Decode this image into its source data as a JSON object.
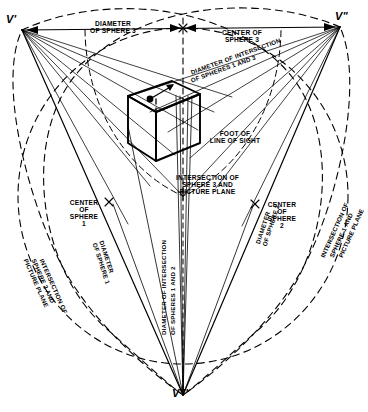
{
  "diagram": {
    "type": "technical-line-drawing",
    "background_color": "#ffffff",
    "ink_color": "#000000",
    "vanishing_points": [
      {
        "id": "v-prime",
        "label": "V'",
        "x": 22,
        "y": 30,
        "role": "left vanishing point"
      },
      {
        "id": "v-double-prime",
        "label": "V\"",
        "x": 340,
        "y": 27,
        "role": "right vanishing point"
      },
      {
        "id": "v-triple-prime",
        "label": "V'''",
        "x": 183,
        "y": 395,
        "role": "bottom vanishing point"
      }
    ],
    "labels": {
      "diameter_of_sphere_3": "DIAMETER\nOF SPHERE 3",
      "center_of_sphere_3": "CENTER OF\nSPHERE 3",
      "diameter_of_intersection_spheres_1_and_3_line1": "DIAMETER OF INTERSECTION",
      "diameter_of_intersection_spheres_1_and_3_line2": "OF SPHERES 1 AND 3",
      "foot_of_line_of_sight": "FOOT OF\nLINE OF SIGHT",
      "intersection_of_sphere_3_and_picture_plane": "INTERSECTION OF\nSPHERE 3 AND\nPICTURE PLANE",
      "center_of_sphere_1": "CENTER\nOF\nSPHERE\n1",
      "center_of_sphere_2": "CENTER\nOF\nSPHERE\n2",
      "diameter_of_intersection_spheres_1_and_2_col1": "DIAMETER OF INTERSECTION",
      "diameter_of_intersection_spheres_1_and_2_col2": "OF SPHERES 1 AND 2",
      "diameter_of_sphere_1": "DIAMETER\nOF SPHERE 1",
      "diameter_of_sphere_2": "DIAMETER\nOF SPHERE 2",
      "intersection_of_sphere_2_and_picture_plane_l1": "INTERSECTION OF",
      "intersection_of_sphere_2_and_picture_plane_l2": "SPHERE 2 AND",
      "intersection_of_sphere_2_and_picture_plane_l3": "PICTURE PLANE",
      "intersection_of_sphere_1_and_picture_plane_l1": "INTERSECTION OF",
      "intersection_of_sphere_1_and_picture_plane_l2": "SPHERE 1 AND",
      "intersection_of_sphere_1_and_picture_plane_l3": "PICTURE PLANE"
    },
    "line_styles": {
      "solid": "construction / object lines",
      "dashed": "sphere trace circles and hidden edges",
      "heavy_solid": "cube object outline"
    },
    "markers": {
      "center_cross": "x",
      "foot_point": "filled dot",
      "arrow_head": "triangular arrow at cube top face"
    }
  }
}
